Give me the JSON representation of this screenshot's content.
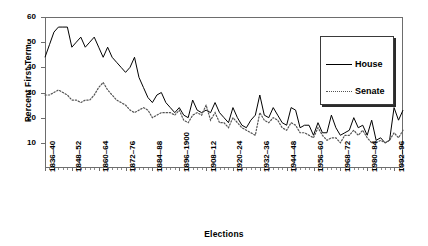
{
  "chart_data": {
    "type": "line",
    "title": "",
    "xlabel": "Elections",
    "ylabel": "Percent First Term",
    "ylim": [
      0,
      60
    ],
    "yticks": [
      10,
      20,
      30,
      40,
      50,
      60
    ],
    "grid": false,
    "legend_position": "top-right",
    "legend_entries": [
      "House",
      "Senate"
    ],
    "xtick_labels": [
      "1836–40",
      "1848–52",
      "1860–64",
      "1872–76",
      "1884–88",
      "1896–1900",
      "1908–12",
      "1920–24",
      "1932–36",
      "1944–48",
      "1956–60",
      "1968–72",
      "1980–84",
      "1992–96"
    ],
    "xtick_indices": [
      0,
      6,
      12,
      18,
      24,
      30,
      36,
      42,
      48,
      54,
      60,
      66,
      72,
      78
    ],
    "x": [
      1836,
      1838,
      1840,
      1842,
      1844,
      1846,
      1848,
      1850,
      1852,
      1854,
      1856,
      1858,
      1860,
      1862,
      1864,
      1866,
      1868,
      1870,
      1872,
      1874,
      1876,
      1878,
      1880,
      1882,
      1884,
      1886,
      1888,
      1890,
      1892,
      1894,
      1896,
      1898,
      1900,
      1902,
      1904,
      1906,
      1908,
      1910,
      1912,
      1914,
      1916,
      1918,
      1920,
      1922,
      1924,
      1926,
      1928,
      1930,
      1932,
      1934,
      1936,
      1938,
      1940,
      1942,
      1944,
      1946,
      1948,
      1950,
      1952,
      1954,
      1956,
      1958,
      1960,
      1962,
      1964,
      1966,
      1968,
      1970,
      1972,
      1974,
      1976,
      1978,
      1980,
      1982,
      1984,
      1986,
      1988,
      1990,
      1992,
      1994,
      1996
    ],
    "series": [
      {
        "name": "House",
        "style": "solid",
        "color": "#000000",
        "values": [
          44,
          49,
          54,
          56,
          56,
          56,
          48,
          50,
          52,
          48,
          50,
          52,
          48,
          44,
          48,
          44,
          42,
          40,
          38,
          40,
          44,
          36,
          32,
          28,
          26,
          29,
          30,
          26,
          24,
          22,
          24,
          21,
          20,
          27,
          23,
          22,
          23,
          22,
          26,
          22,
          20,
          18,
          24,
          20,
          17,
          16,
          19,
          21,
          29,
          21,
          20,
          24,
          21,
          18,
          17,
          24,
          23,
          16,
          17,
          17,
          13,
          18,
          14,
          14,
          21,
          16,
          13,
          14,
          15,
          20,
          16,
          17,
          13,
          19,
          11,
          12,
          10,
          11,
          24,
          19,
          23
        ]
      },
      {
        "name": "Senate",
        "style": "dotted",
        "color": "#555555",
        "values": [
          29,
          29,
          30,
          31,
          30,
          29,
          27,
          27,
          26,
          27,
          27,
          29,
          32,
          34,
          31,
          29,
          27,
          26,
          25,
          23,
          22,
          23,
          24,
          23,
          20,
          21,
          22,
          22,
          22,
          21,
          23,
          19,
          18,
          21,
          22,
          21,
          25,
          19,
          22,
          18,
          18,
          16,
          20,
          18,
          16,
          15,
          14,
          13,
          22,
          19,
          18,
          20,
          19,
          16,
          15,
          18,
          17,
          14,
          14,
          13,
          12,
          16,
          13,
          11,
          12,
          12,
          10,
          13,
          13,
          15,
          13,
          15,
          12,
          10,
          10,
          11,
          10,
          11,
          14,
          12,
          15
        ]
      }
    ]
  }
}
